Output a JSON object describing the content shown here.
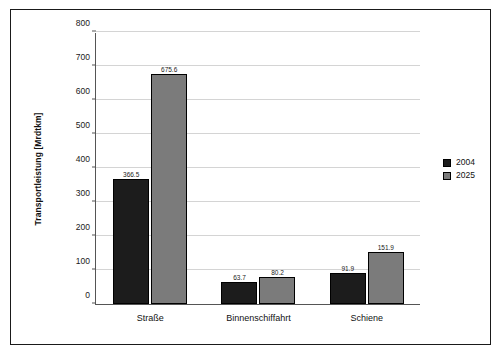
{
  "chart_data": {
    "type": "bar",
    "title": "",
    "xlabel": "",
    "ylabel": "Transportleistung [Mrdtkm]",
    "ylim": [
      0,
      800
    ],
    "yticks": [
      0,
      100,
      200,
      300,
      400,
      500,
      600,
      700,
      800
    ],
    "ytick_labels": [
      "0",
      "100",
      "200",
      "300",
      "400",
      "500",
      "600",
      "700",
      "800"
    ],
    "grid": true,
    "legend_position": "right",
    "categories": [
      "Straße",
      "Binnenschiffahrt",
      "Schiene"
    ],
    "series": [
      {
        "name": "2004",
        "color": "#1c1c1c",
        "values": [
          366.5,
          63.7,
          91.9
        ],
        "labels": [
          "366.5",
          "63.7",
          "91.9"
        ]
      },
      {
        "name": "2025",
        "color": "#7b7b7b",
        "values": [
          675.6,
          80.2,
          151.9
        ],
        "labels": [
          "675.6",
          "80.2",
          "151.9"
        ]
      }
    ]
  },
  "legend": {
    "items": [
      {
        "label": "2004",
        "color": "#1c1c1c"
      },
      {
        "label": "2025",
        "color": "#7b7b7b"
      }
    ]
  }
}
